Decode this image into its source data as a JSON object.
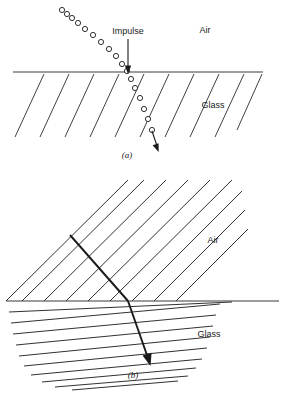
{
  "figure": {
    "panels": [
      {
        "key": "a",
        "caption": "(a)",
        "model": "corpuscular",
        "labels": {
          "medium_upper": "Air",
          "medium_lower": "Glass",
          "impulse": "Impulse"
        },
        "colors": {
          "ink": "#1a1a1a",
          "interface": "#3a3a3a",
          "hatch": "#2a2a2a",
          "circle_stroke": "#1a1a1a",
          "circle_fill": "#ffffff"
        },
        "interface_y": 72,
        "interface_x0": 13,
        "interface_x1": 263,
        "incident_circles": [
          {
            "cx": 62,
            "cy": 10,
            "r": 2.6
          },
          {
            "cx": 67,
            "cy": 14,
            "r": 2.6
          },
          {
            "cx": 72,
            "cy": 18,
            "r": 2.6
          },
          {
            "cx": 78,
            "cy": 23,
            "r": 2.6
          },
          {
            "cx": 85,
            "cy": 29,
            "r": 2.6
          },
          {
            "cx": 93,
            "cy": 35,
            "r": 2.6
          },
          {
            "cx": 101,
            "cy": 42,
            "r": 2.6
          },
          {
            "cx": 109,
            "cy": 49,
            "r": 2.6
          },
          {
            "cx": 116,
            "cy": 56,
            "r": 2.6
          },
          {
            "cx": 122,
            "cy": 64,
            "r": 2.6
          },
          {
            "cx": 127,
            "cy": 71,
            "r": 2.6
          }
        ],
        "refracted_circles": [
          {
            "cx": 131,
            "cy": 79,
            "r": 2.6
          },
          {
            "cx": 135,
            "cy": 88,
            "r": 2.6
          },
          {
            "cx": 140,
            "cy": 98,
            "r": 2.6
          },
          {
            "cx": 144,
            "cy": 109,
            "r": 2.6
          },
          {
            "cx": 148,
            "cy": 119,
            "r": 2.6
          },
          {
            "cx": 152,
            "cy": 130,
            "r": 2.6
          }
        ],
        "impulse_arrow": {
          "x": 128,
          "y_top": 39,
          "y_tip": 72
        },
        "exit_arrow": {
          "x1": 152,
          "y1": 130,
          "x2": 158,
          "y2": 150
        }
      },
      {
        "key": "b",
        "caption": "(b)",
        "model": "wave",
        "labels": {
          "medium_upper": "Air",
          "medium_lower": "Glass",
          "impulse": ""
        },
        "colors": {
          "ink": "#1a1a1a",
          "interface": "#3a3a3a",
          "hatch": "#2a2a2a"
        },
        "interface_y": 301,
        "interface_x0": 6,
        "interface_x1": 279,
        "air_wavefront_angle_deg": 45,
        "glass_wavefront_angle_deg": 20,
        "ray": {
          "x1": 70,
          "y1": 235,
          "x2": 128,
          "y2": 301,
          "x3": 150,
          "y3": 364
        }
      }
    ]
  }
}
